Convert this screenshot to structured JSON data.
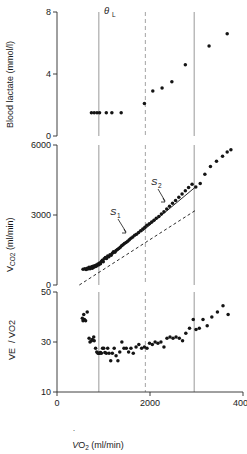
{
  "figure": {
    "title": "",
    "xaxis": {
      "label_main": "V",
      "label_dot": "̇",
      "label_rest": "O",
      "label_sub": "2",
      "label_units": "(ml/min)",
      "label_full": "VO2 (ml/min)",
      "ticks": [
        0,
        2000,
        4000
      ],
      "ticklabels": [
        "0",
        "2000",
        "4000"
      ],
      "min": 0,
      "max": 4000
    },
    "markers": {
      "theta_label": "θ",
      "theta_sub": "L",
      "theta_full": "θL",
      "theta_x": 1900,
      "solid_line_1_x": 900,
      "solid_line_2_x": 2950
    },
    "panels": [
      {
        "id": "blood-lactate",
        "ylabel": "Blood lactate (mmol/l)",
        "yticks": [
          0,
          4,
          8
        ],
        "yticklabels": [
          "0",
          "4",
          "8"
        ],
        "ymin": 0,
        "ymax": 8
      },
      {
        "id": "vco2",
        "ylabel_main": "V",
        "ylabel_sub": "CO2",
        "ylabel_units": "(ml/min)",
        "ylabel_full": "VCO2 (ml/min)",
        "yticks": [
          0,
          3000,
          6000
        ],
        "yticklabels": [
          "0",
          "3000",
          "6000"
        ],
        "ymin": 0,
        "ymax": 6000,
        "annotations": [
          {
            "label": "S",
            "sub": "1",
            "full": "S1",
            "x": 1330,
            "y": 2600
          },
          {
            "label": "S",
            "sub": "2",
            "full": "S2",
            "x": 2420,
            "y": 4450
          }
        ]
      },
      {
        "id": "ve-vo2",
        "ylabel_num": "VE",
        "ylabel_den": "VO2",
        "ylabel_full": "VE/VO2",
        "yticks": [
          10,
          30,
          50
        ],
        "yticklabels": [
          "10",
          "30",
          "50"
        ],
        "ymin": 10,
        "ymax": 50
      }
    ]
  },
  "chart_data": [
    {
      "type": "scatter",
      "panel": "blood-lactate",
      "title": "Blood lactate (mmol/l)",
      "xlabel": "VO2 (ml/min)",
      "ylabel": "Blood lactate (mmol/l)",
      "xlim": [
        0,
        4000
      ],
      "ylim": [
        0,
        8
      ],
      "grid": false,
      "x": [
        740,
        800,
        860,
        915,
        1060,
        1180,
        1380,
        1880,
        2060,
        2260,
        2470,
        2760,
        3270,
        3660
      ],
      "y": [
        1.5,
        1.5,
        1.5,
        1.5,
        1.5,
        1.5,
        1.5,
        2.1,
        2.9,
        3.1,
        3.5,
        4.6,
        5.8,
        6.6
      ]
    },
    {
      "type": "scatter",
      "panel": "vco2",
      "title": "VCO2 (ml/min)",
      "xlabel": "VO2 (ml/min)",
      "ylabel": "VCO2 (ml/min)",
      "xlim": [
        0,
        4000
      ],
      "ylim": [
        0,
        6000
      ],
      "grid": false,
      "x": [
        560,
        600,
        625,
        650,
        660,
        690,
        710,
        730,
        745,
        760,
        775,
        790,
        810,
        830,
        845,
        860,
        880,
        900,
        915,
        935,
        955,
        975,
        995,
        1015,
        1040,
        1065,
        1090,
        1115,
        1140,
        1165,
        1190,
        1215,
        1245,
        1270,
        1300,
        1330,
        1360,
        1390,
        1420,
        1450,
        1485,
        1520,
        1555,
        1590,
        1630,
        1670,
        1710,
        1755,
        1800,
        1845,
        1890,
        1935,
        1985,
        2035,
        2085,
        2135,
        2190,
        2245,
        2300,
        2360,
        2420,
        2485,
        2550,
        2620,
        2690,
        2760,
        2830,
        2905,
        2985,
        3080,
        3180,
        3300,
        3430,
        3560,
        3660,
        3740
      ],
      "y": [
        680,
        700,
        660,
        720,
        690,
        760,
        700,
        740,
        780,
        720,
        800,
        760,
        820,
        790,
        860,
        830,
        900,
        870,
        940,
        910,
        1010,
        1060,
        1000,
        1120,
        1180,
        1140,
        1240,
        1210,
        1300,
        1270,
        1360,
        1420,
        1400,
        1480,
        1520,
        1560,
        1620,
        1680,
        1720,
        1780,
        1820,
        1880,
        1940,
        2000,
        2060,
        2130,
        2180,
        2250,
        2320,
        2400,
        2480,
        2560,
        2620,
        2700,
        2780,
        2860,
        2940,
        3040,
        3140,
        3260,
        3380,
        3500,
        3620,
        3760,
        3900,
        4040,
        4180,
        4320,
        4200,
        4350,
        4750,
        5080,
        5300,
        5520,
        5700,
        5800
      ],
      "fit_lines": [
        {
          "name": "S1",
          "style": "dashed",
          "x0": 480,
          "y0": 0,
          "x1": 2980,
          "y1": 3200
        },
        {
          "name": "S2",
          "style": "solid",
          "x0": 1820,
          "y0": 2280,
          "x1": 2990,
          "y1": 4220
        }
      ]
    },
    {
      "type": "scatter",
      "panel": "ve-vo2",
      "title": "VE/VO2",
      "xlabel": "VO2 (ml/min)",
      "ylabel": "VE/VO2",
      "xlim": [
        0,
        4000
      ],
      "ylim": [
        10,
        50
      ],
      "grid": false,
      "x": [
        545,
        560,
        575,
        590,
        615,
        650,
        690,
        710,
        740,
        760,
        790,
        800,
        830,
        855,
        880,
        900,
        915,
        935,
        955,
        980,
        1005,
        1030,
        1060,
        1090,
        1120,
        1155,
        1190,
        1230,
        1270,
        1310,
        1350,
        1395,
        1440,
        1490,
        1540,
        1590,
        1640,
        1700,
        1760,
        1820,
        1880,
        1935,
        1990,
        2050,
        2110,
        2170,
        2235,
        2300,
        2365,
        2430,
        2495,
        2560,
        2630,
        2700,
        2770,
        2850,
        2930,
        2990,
        3060,
        3140,
        3230,
        3330,
        3450,
        3570,
        3680
      ],
      "y": [
        39.5,
        38.5,
        41.0,
        39.0,
        38.5,
        42.0,
        31.5,
        30.0,
        30.5,
        31.0,
        32.0,
        30.5,
        27.5,
        26.0,
        25.5,
        25.5,
        25.5,
        25.8,
        25.5,
        27.5,
        27.5,
        25.8,
        25.5,
        27.5,
        25.5,
        22.5,
        25.5,
        27.5,
        24.5,
        22.5,
        26.0,
        30.0,
        27.5,
        27.5,
        26.0,
        27.5,
        25.5,
        28.0,
        29.0,
        27.5,
        28.0,
        27.5,
        29.5,
        29.0,
        30.0,
        29.5,
        30.0,
        28.0,
        31.5,
        32.0,
        31.5,
        32.0,
        31.5,
        30.5,
        33.5,
        35.5,
        39.0,
        35.0,
        35.5,
        39.0,
        36.5,
        40.0,
        42.0,
        44.5,
        41.0
      ]
    }
  ]
}
